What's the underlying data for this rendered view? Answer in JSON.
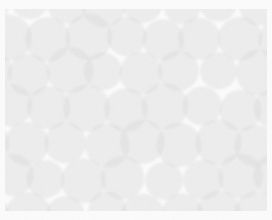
{
  "artwork": {
    "title": "Overlapping Circles Texture",
    "kind": "abstract-pattern",
    "description": "Field of translucent light gray overlapping circles in offset hexagonal packing on a near-white ground"
  },
  "canvas": {
    "width": 272,
    "height": 220,
    "background_color": "#fcfcfc"
  },
  "clip_region": {
    "x": 5,
    "y": 9,
    "width": 262,
    "height": 202
  },
  "palette": {
    "background": "#fcfcfc",
    "circle_fill": "#dcdcdc",
    "overlap_two": "#c9c9c9",
    "overlap_three": "#bcbcbc",
    "gap_white": "#fbfbfb",
    "grain": "#b9b9b9"
  },
  "pattern": {
    "shape": "circle",
    "packing": "offset-hexagonal",
    "circle_radius": 21,
    "column_pitch": 38,
    "row_pitch": 35,
    "row_offset": 19,
    "columns": 8,
    "rows": 7,
    "fill_opacity": 0.42,
    "jitter_amount": 3.2,
    "radius_jitter": 2.6,
    "blur_radius": 1.1,
    "seed": 20250614
  },
  "grain": {
    "enabled": true,
    "opacity": 0.5,
    "base_frequency": 0.82,
    "octaves": 3,
    "intensity": 0.13
  }
}
